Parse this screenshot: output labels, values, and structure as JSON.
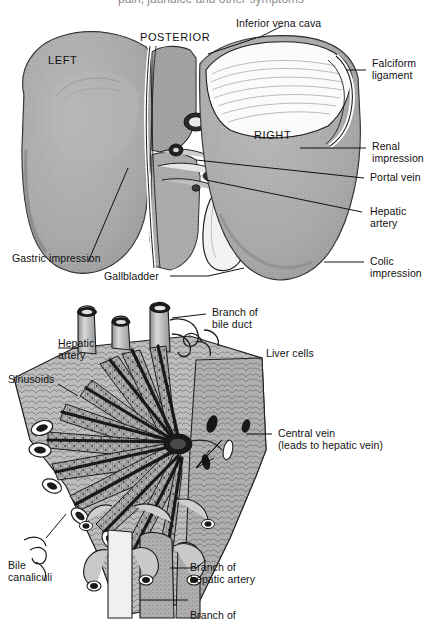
{
  "page": {
    "title_partial": "pain, jaundice and other symptoms",
    "background": "#ffffff",
    "ink": "#1b1b1b",
    "tissue_fill": "#a8a8a8",
    "tissue_light": "#d8d8d8",
    "width": 438,
    "height": 622
  },
  "figures": [
    {
      "id": "figure-liver-posterior",
      "name": "liver-gross-anatomy",
      "orientation_label": "POSTERIOR",
      "lobe_labels": [
        "LEFT",
        "RIGHT"
      ],
      "labels": [
        {
          "key": "inferior_vena_cava",
          "text": "Inferior vena cava"
        },
        {
          "key": "falciform_ligament",
          "text": "Falciform\nligament"
        },
        {
          "key": "renal_impression",
          "text": "Renal\nimpression"
        },
        {
          "key": "portal_vein",
          "text": "Portal vein"
        },
        {
          "key": "hepatic_artery",
          "text": "Hepatic\nartery"
        },
        {
          "key": "colic_impression",
          "text": "Colic\nimpression"
        },
        {
          "key": "gastric_impression",
          "text": "Gastric impression"
        },
        {
          "key": "gallbladder",
          "text": "Gallbladder"
        }
      ]
    },
    {
      "id": "figure-liver-lobule",
      "name": "liver-lobule-microstructure",
      "labels": [
        {
          "key": "hepatic_artery",
          "text": "Hepatic\nartery"
        },
        {
          "key": "branch_of_bile_duct",
          "text": "Branch of\nbile duct"
        },
        {
          "key": "liver_cells",
          "text": "Liver cells"
        },
        {
          "key": "sinusoids",
          "text": "Sinusoids"
        },
        {
          "key": "central_vein",
          "text": "Central vein\n(leads to hepatic vein)"
        },
        {
          "key": "bile_canaliculi",
          "text": "Bile\ncanaliculi"
        },
        {
          "key": "branch_of_hepatic_artery",
          "text": "Branch of\nhepatic artery"
        },
        {
          "key": "branch_of_cutoff",
          "text": "Branch of"
        }
      ]
    }
  ],
  "labels_flat": {
    "posterior": "POSTERIOR",
    "left": "LEFT",
    "right": "RIGHT",
    "inferior_vena_cava": "Inferior vena cava",
    "falciform_ligament_l1": "Falciform",
    "falciform_ligament_l2": "ligament",
    "renal_impression_l1": "Renal",
    "renal_impression_l2": "impression",
    "portal_vein": "Portal vein",
    "hepatic_artery_l1": "Hepatic",
    "hepatic_artery_l2": "artery",
    "colic_impression_l1": "Colic",
    "colic_impression_l2": "impression",
    "gastric_impression": "Gastric impression",
    "gallbladder": "Gallbladder",
    "lobule_hepatic_artery_l1": "Hepatic",
    "lobule_hepatic_artery_l2": "artery",
    "branch_bile_duct_l1": "Branch of",
    "branch_bile_duct_l2": "bile duct",
    "liver_cells": "Liver cells",
    "sinusoids": "Sinusoids",
    "central_vein_l1": "Central vein",
    "central_vein_l2": "(leads to hepatic vein)",
    "bile_canaliculi_l1": "Bile",
    "bile_canaliculi_l2": "canaliculi",
    "branch_hepatic_artery_l1": "Branch of",
    "branch_hepatic_artery_l2": "hepatic artery",
    "branch_cutoff": "Branch of",
    "page_title_partial": "pain, jaundice and other symptoms"
  }
}
